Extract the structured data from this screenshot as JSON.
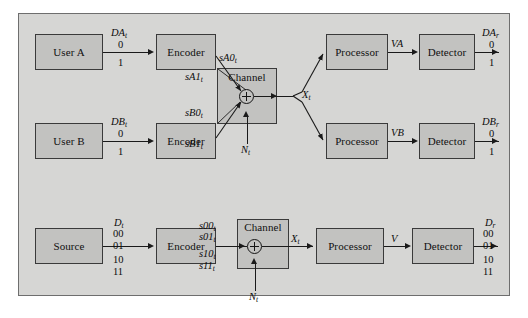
{
  "figure": {
    "background_color": "#d6d6d4",
    "block_fill": "#c2c2c0",
    "line_color": "#1a1a1a"
  },
  "diagram_top": {
    "title": "Two-user multiple access channel",
    "blocks": {
      "user_a": "User A",
      "user_b": "User B",
      "encoder_a": "Encoder",
      "encoder_b": "Encoder",
      "channel": "Channel",
      "processor_a": "Processor",
      "processor_b": "Processor",
      "detector_a": "Detector",
      "detector_b": "Detector"
    },
    "signals": {
      "da_t": "DA",
      "da_t_sub": "t",
      "db_t": "DB",
      "db_t_sub": "t",
      "sa0": "sA0",
      "sa0_sub": "t",
      "sa1": "sA1",
      "sa1_sub": "t",
      "sb0": "sB0",
      "sb0_sub": "t",
      "sb1": "sB1",
      "sb1_sub": "t",
      "noise": "N",
      "noise_sub": "t",
      "x_t": "X",
      "x_t_sub": "t",
      "va": "VA",
      "vb": "VB",
      "da_r": "DA",
      "da_r_sub": "r",
      "db_r": "DB",
      "db_r_sub": "r"
    },
    "alphabet": {
      "in_a": [
        "0",
        "1"
      ],
      "in_b": [
        "0",
        "1"
      ],
      "out_a": [
        "0",
        "1"
      ],
      "out_b": [
        "0",
        "1"
      ]
    },
    "adder_symbol": "plus-in-circle"
  },
  "diagram_bottom": {
    "title": "Single-source four-symbol channel",
    "blocks": {
      "source": "Source",
      "encoder": "Encoder",
      "channel": "Channel",
      "processor": "Processor",
      "detector": "Detector"
    },
    "signals": {
      "d_t": "D",
      "d_t_sub": "t",
      "s00": "s00",
      "s00_sub": "t",
      "s01": "s01",
      "s01_sub": "t",
      "s10": "s10",
      "s10_sub": "t",
      "s11": "s11",
      "s11_sub": "t",
      "noise": "N",
      "noise_sub": "t",
      "x_t": "X",
      "x_t_sub": "t",
      "v": "V",
      "d_r": "D",
      "d_r_sub": "r"
    },
    "alphabet": {
      "input": [
        "00",
        "01",
        "10",
        "11"
      ],
      "output": [
        "00",
        "01",
        "10",
        "11"
      ]
    },
    "adder_symbol": "plus-in-circle"
  }
}
